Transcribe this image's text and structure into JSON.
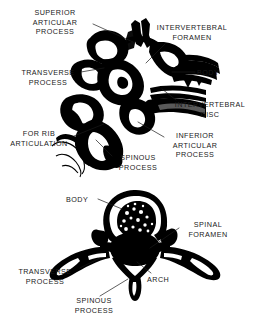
{
  "figure": {
    "background_color": "#ffffff",
    "ink_color": "#000000",
    "text_color": "#1a1a1a",
    "style": "black-and-white anatomical line illustration"
  },
  "panels": [
    {
      "id": "lateral-view",
      "name": "vertebrae-lateral-view",
      "description": "Lateral (side) view of articulated thoracic vertebrae",
      "labels": [
        {
          "id": "superior-articular-process",
          "text": "SUPERIOR\nARTICULAR\nPROCESS",
          "x": 18,
          "y": 8,
          "w": 74,
          "align": "center"
        },
        {
          "id": "intervertebral-foramen",
          "text": "INTERVERTEBRAL\nFORAMEN",
          "x": 152,
          "y": 23,
          "w": 80,
          "align": "center"
        },
        {
          "id": "transverse-process",
          "text": "TRANSVERSE\nPROCESS",
          "x": 16,
          "y": 68,
          "w": 64,
          "align": "center"
        },
        {
          "id": "body",
          "text": "BODY",
          "x": 197,
          "y": 68,
          "w": 30,
          "align": "left"
        },
        {
          "id": "intervertebral-disc",
          "text": "INTERVERTEBRAL\nDISC",
          "x": 169,
          "y": 100,
          "w": 82,
          "align": "center"
        },
        {
          "id": "for-rib-articulation",
          "text": "FOR RIB\nARTICULATION",
          "x": 6,
          "y": 129,
          "w": 68,
          "align": "center"
        },
        {
          "id": "inferior-articular-process",
          "text": "INFERIOR\nARTICULAR\nPROCESS",
          "x": 166,
          "y": 131,
          "w": 58,
          "align": "center"
        },
        {
          "id": "spinous-process",
          "text": "SPINOUS\nPROCESS",
          "x": 110,
          "y": 153,
          "w": 56,
          "align": "center"
        }
      ]
    },
    {
      "id": "superior-view",
      "name": "vertebra-superior-view",
      "description": "Superior (top-down) view of a single vertebra",
      "labels": [
        {
          "id": "body",
          "text": "BODY",
          "x": 66,
          "y": 195,
          "w": 30,
          "align": "left"
        },
        {
          "id": "spinal-foramen",
          "text": "SPINAL\nFORAMEN",
          "x": 181,
          "y": 220,
          "w": 52,
          "align": "center"
        },
        {
          "id": "transverse-process",
          "text": "TRANSVERSE\nPROCESS",
          "x": 14,
          "y": 267,
          "w": 64,
          "align": "center"
        },
        {
          "id": "arch",
          "text": "ARCH",
          "x": 147,
          "y": 275,
          "w": 30,
          "align": "left"
        },
        {
          "id": "spinous-process",
          "text": "SPINOUS\nPROCESS",
          "x": 66,
          "y": 296,
          "w": 56,
          "align": "center"
        }
      ]
    }
  ],
  "leader_lines": {
    "description": "thin straight pointer lines connecting each text label to its anatomical structure",
    "color": "#1a1a1a",
    "width": 0.7
  }
}
